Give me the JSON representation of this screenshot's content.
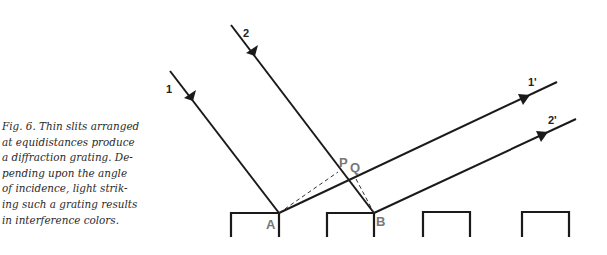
{
  "caption": {
    "lines": [
      "Fig. 6. Thin slits arranged",
      "at equidistances produce",
      "a diffraction grating. De-",
      "pending upon the angle",
      "of incidence, light strik-",
      "ing such a grating results",
      "in interference colors."
    ]
  },
  "diagram": {
    "ray_labels": {
      "incident_1": "1",
      "incident_2": "2",
      "diffracted_1": "1'",
      "diffracted_2": "2'"
    },
    "point_labels": {
      "A": "A",
      "B": "B",
      "P": "P",
      "Q": "Q"
    },
    "colors": {
      "line": "#1a1a1a",
      "point_label": "#777777"
    }
  }
}
